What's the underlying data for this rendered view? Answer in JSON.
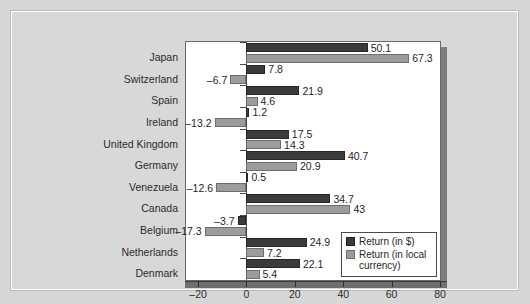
{
  "chart_data": {
    "type": "bar",
    "orientation": "horizontal",
    "title": "",
    "subtitle": "",
    "xlabel": "",
    "ylabel": "",
    "xlim": [
      -25,
      80
    ],
    "xticks": [
      -20,
      0,
      20,
      40,
      60,
      80
    ],
    "xtick_labels": [
      "–20",
      "0",
      "20",
      "40",
      "60",
      "80"
    ],
    "grid": false,
    "legend_position": "bottom-right",
    "categories": [
      "Japan",
      "Switzerland",
      "Spain",
      "Ireland",
      "United Kingdom",
      "Germany",
      "Venezuela",
      "Canada",
      "Belgium",
      "Netherlands",
      "Denmark"
    ],
    "series": [
      {
        "name": "Return (in $)",
        "color": "#3b3b3b",
        "values": [
          50.1,
          7.8,
          21.9,
          1.2,
          17.5,
          40.7,
          0.5,
          34.7,
          -3.7,
          24.9,
          22.1
        ],
        "labels": [
          "50.1",
          "7.8",
          "21.9",
          "1.2",
          "17.5",
          "40.7",
          "0.5",
          "34.7",
          "–3.7",
          "24.9",
          "22.1"
        ]
      },
      {
        "name": "Return (in local currency)",
        "color": "#9c9c9c",
        "values": [
          67.3,
          -6.7,
          4.6,
          -13.2,
          14.3,
          20.9,
          -12.6,
          43,
          -17.3,
          7.2,
          5.4
        ],
        "labels": [
          "67.3",
          "–6.7",
          "4.6",
          "–13.2",
          "14.3",
          "20.9",
          "–12.6",
          "43",
          "–17.3",
          "7.2",
          "5.4"
        ]
      }
    ],
    "legend": [
      {
        "label": "Return (in $)",
        "color": "#3b3b3b"
      },
      {
        "label": "Return (in local currency)",
        "color": "#9c9c9c"
      }
    ]
  }
}
